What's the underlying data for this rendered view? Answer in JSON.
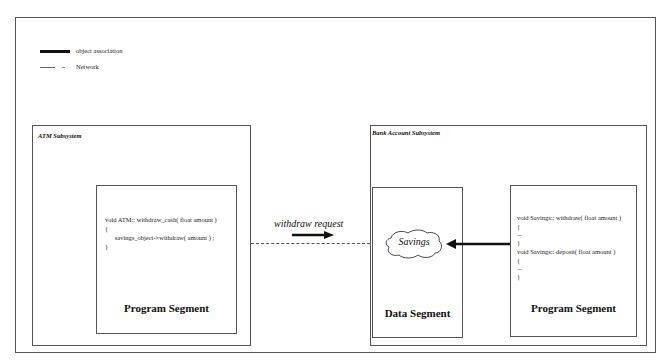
{
  "legend": {
    "items": [
      {
        "label": "object association",
        "style": "solid-thick"
      },
      {
        "label": "Network",
        "style": "dashed-thin"
      }
    ]
  },
  "atm_subsystem": {
    "title": "ATM Subsystem",
    "program_segment": {
      "label": "Program Segment",
      "code": [
        "void ATM:: withdraw_cash( float amount )",
        "{",
        "      savings_object->withdraw( amount ) ;",
        "}"
      ]
    }
  },
  "network": {
    "message_label": "withdraw request"
  },
  "bank_subsystem": {
    "title": "Bank Account Subsystem",
    "data_segment": {
      "label": "Data Segment",
      "object_name": "Savings"
    },
    "program_segment": {
      "label": "Program Segment",
      "code": [
        "void Savings:: withdraw( float amount )",
        "{",
        "...",
        "}",
        "void Savings:: deposit( float amount )",
        "{",
        "...",
        "}"
      ]
    }
  },
  "colors": {
    "border": "#555555",
    "line": "#111111",
    "background": "#ffffff"
  }
}
